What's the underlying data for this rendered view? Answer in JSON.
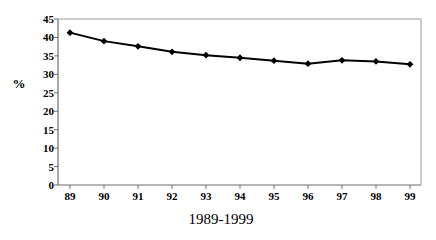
{
  "chart_data": {
    "type": "line",
    "title": "",
    "subtitle": "",
    "xlabel": "1989-1999",
    "ylabel": "%",
    "categories": [
      "89",
      "90",
      "91",
      "92",
      "93",
      "94",
      "95",
      "96",
      "97",
      "98",
      "99"
    ],
    "values": [
      41.3,
      39.0,
      37.6,
      36.1,
      35.2,
      34.5,
      33.7,
      32.9,
      33.8,
      33.5,
      32.7
    ],
    "series": [
      {
        "name": "",
        "values": [
          41.3,
          39.0,
          37.6,
          36.1,
          35.2,
          34.5,
          33.7,
          32.9,
          33.8,
          33.5,
          32.7
        ]
      }
    ],
    "ylim": [
      0,
      45
    ],
    "yticks": [
      0,
      5,
      10,
      15,
      20,
      25,
      30,
      35,
      40,
      45
    ],
    "ytick_labels": [
      "0",
      "5",
      "10",
      "15",
      "20",
      "25",
      "30",
      "35",
      "40",
      "45"
    ],
    "xtick_labels": [
      "89",
      "90",
      "91",
      "92",
      "93",
      "94",
      "95",
      "96",
      "97",
      "98",
      "99"
    ],
    "grid": false,
    "legend": false,
    "legend_position": "none",
    "marker": "diamond",
    "line_color": "#000000",
    "marker_color": "#000000",
    "axis_color": "#808080",
    "plot_background": "#ffffff"
  },
  "axes": {
    "y_unit_label": "%",
    "x_axis_title": "1989-1999"
  }
}
